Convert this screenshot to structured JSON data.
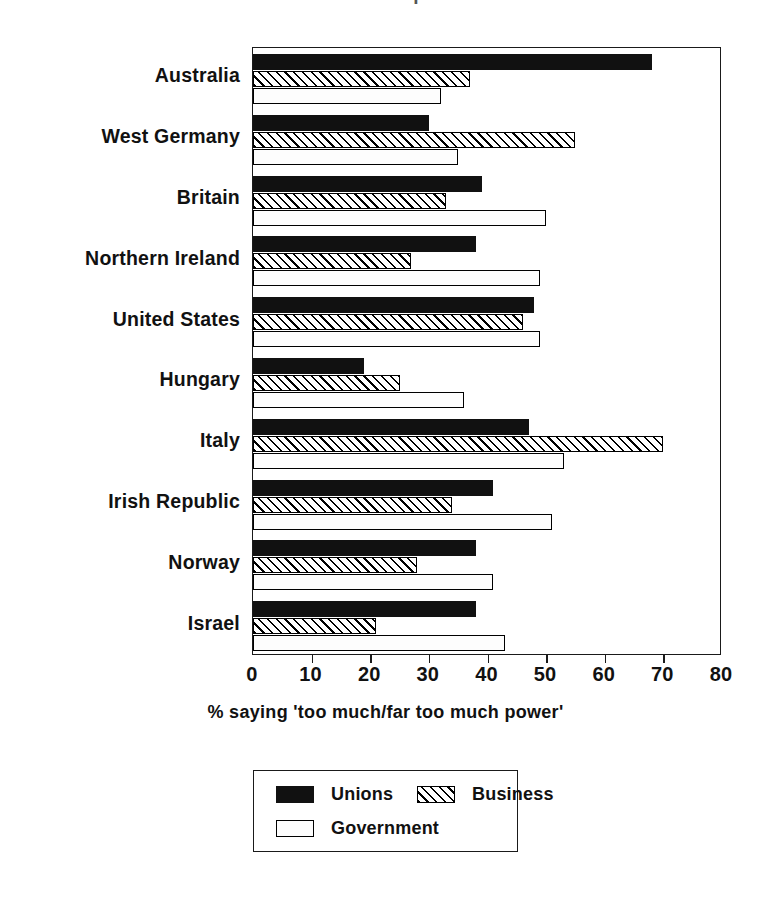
{
  "title_remnant": "attitudes to power",
  "chart_data": {
    "type": "bar",
    "orientation": "horizontal",
    "title": "",
    "xlabel": "% saying 'too much/far too much power'",
    "ylabel": "",
    "xlim": [
      0,
      80
    ],
    "xticks": [
      0,
      10,
      20,
      30,
      40,
      50,
      60,
      70,
      80
    ],
    "xtick_labels": [
      "0",
      "10",
      "20",
      "30",
      "40",
      "50",
      "60",
      "70",
      "80"
    ],
    "grid": false,
    "legend_position": "bottom",
    "categories": [
      "Australia",
      "West Germany",
      "Britain",
      "Northern Ireland",
      "United States",
      "Hungary",
      "Italy",
      "Irish Republic",
      "Norway",
      "Israel"
    ],
    "series": [
      {
        "name": "Unions",
        "pattern": "solid-black",
        "color": "#111111",
        "values": [
          68,
          30,
          39,
          38,
          48,
          19,
          47,
          41,
          38,
          38
        ]
      },
      {
        "name": "Business",
        "pattern": "diagonal-hatch",
        "color": "#000000",
        "values": [
          37,
          55,
          33,
          27,
          46,
          25,
          70,
          34,
          28,
          21
        ]
      },
      {
        "name": "Government",
        "pattern": "dotted",
        "color": "#444444",
        "values": [
          32,
          35,
          50,
          49,
          49,
          36,
          53,
          51,
          41,
          43
        ]
      }
    ]
  },
  "legend": {
    "entries": [
      {
        "label": "Unions",
        "swatch": "unions"
      },
      {
        "label": "Business",
        "swatch": "business"
      },
      {
        "label": "Government",
        "swatch": "government"
      }
    ]
  }
}
